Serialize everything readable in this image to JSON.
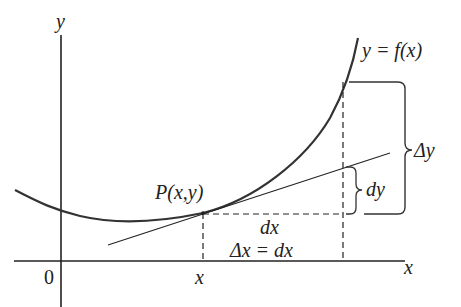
{
  "diagram": {
    "colors": {
      "curve": "#333333",
      "axes": "#222222",
      "text": "#222222",
      "background": "#ffffff"
    },
    "labels": {
      "y_axis": "y",
      "x_axis": "x",
      "origin": "0",
      "x_tick": "x",
      "curve": "y = f(x)",
      "point": "P(x,y)",
      "dx": "dx",
      "delta_x": "Δx = dx",
      "dy": "dy",
      "delta_y": "Δy"
    }
  }
}
